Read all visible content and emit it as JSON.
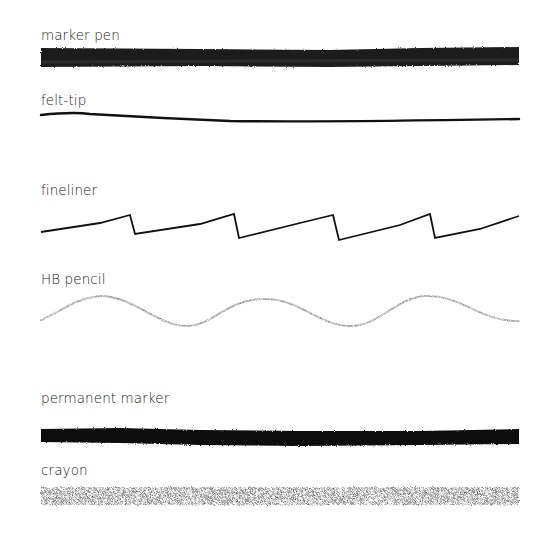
{
  "samples": [
    {
      "label": "marker pen",
      "style": "thick-marker",
      "color": "#1c1c1c"
    },
    {
      "label": "felt-tip",
      "style": "thin-wavy-line",
      "color": "#111111"
    },
    {
      "label": "fineliner",
      "style": "sawtooth-line",
      "color": "#111111"
    },
    {
      "label": "HB pencil",
      "style": "sine-wave-graphite",
      "color": "#8a8a8a"
    },
    {
      "label": "permanent marker",
      "style": "thick-solid",
      "color": "#0e0e0e"
    },
    {
      "label": "crayon",
      "style": "textured-thick",
      "color": "#3a3a3a"
    }
  ]
}
